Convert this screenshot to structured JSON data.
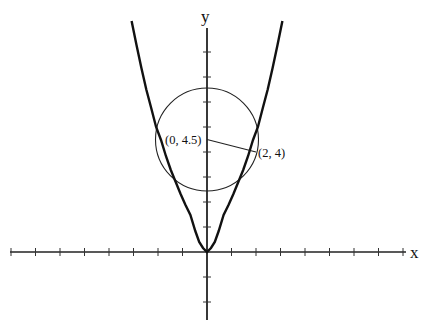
{
  "diagram": {
    "axes": {
      "x_label": "x",
      "y_label": "y"
    },
    "curve": {
      "equation": "y = x^2"
    },
    "circle": {
      "center": [
        0,
        4.5
      ],
      "radius_to": [
        2,
        4
      ]
    },
    "points": [
      {
        "label": "(0, 4.5)",
        "x": 0,
        "y": 4.5
      },
      {
        "label": "(2, 4)",
        "x": 2,
        "y": 4
      }
    ],
    "colors": {
      "stroke": "#111111",
      "background": "#ffffff"
    }
  }
}
